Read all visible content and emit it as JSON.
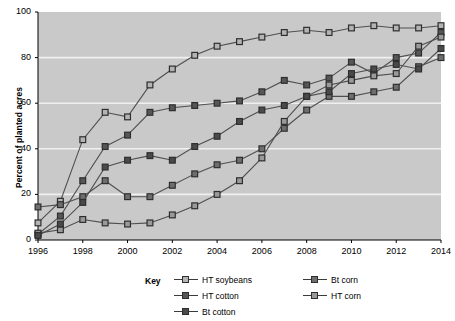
{
  "chart_data": {
    "type": "line",
    "title": "",
    "xlabel": "",
    "ylabel": "Percent of planted acres",
    "xlim": [
      1996,
      2014
    ],
    "ylim": [
      0,
      100
    ],
    "grid": "horizontal",
    "legend_position": "bottom",
    "legend_title": "Key",
    "x": [
      1996,
      1997,
      1998,
      1999,
      2000,
      2001,
      2002,
      2003,
      2004,
      2005,
      2006,
      2007,
      2008,
      2009,
      2010,
      2011,
      2012,
      2013,
      2014
    ],
    "xticks": [
      "1996",
      "1998",
      "2000",
      "2002",
      "2004",
      "2006",
      "2008",
      "2010",
      "2012",
      "2014"
    ],
    "yticks": [
      "0",
      "20",
      "40",
      "60",
      "80",
      "100"
    ],
    "series": [
      {
        "name": "HT soybeans",
        "color": "#4f4f4f",
        "marker_fill": "#b4b4b4",
        "values": [
          7.5,
          17,
          44,
          56,
          54,
          68,
          75,
          81,
          85,
          87,
          89,
          91,
          92,
          91,
          93,
          94,
          93,
          93,
          94
        ]
      },
      {
        "name": "Bt corn",
        "color": "#4f4f4f",
        "marker_fill": "#6e6e6e",
        "values": [
          14.5,
          15.5,
          19,
          26,
          19,
          19,
          24,
          29,
          33,
          35,
          40,
          49,
          57,
          63,
          63,
          65,
          67,
          76,
          80
        ]
      },
      {
        "name": "HT cotton",
        "color": "#4f4f4f",
        "marker_fill": "#565656",
        "values": [
          2.5,
          10.5,
          26,
          41,
          46,
          56,
          58,
          59,
          60,
          61,
          65,
          70,
          68,
          71,
          78,
          73,
          80,
          82,
          91
        ]
      },
      {
        "name": "HT corn",
        "color": "#4f4f4f",
        "marker_fill": "#9a9a9a",
        "values": [
          3,
          4.5,
          9,
          7.5,
          7,
          7.5,
          11,
          15,
          20,
          26,
          36,
          52,
          63,
          68,
          70,
          72,
          73,
          85,
          89
        ]
      },
      {
        "name": "Bt cotton",
        "color": "#4f4f4f",
        "marker_fill": "#4a4a4a",
        "values": [
          2,
          7,
          16.5,
          32,
          35,
          37,
          35,
          41,
          45.5,
          52,
          57,
          59,
          63,
          65,
          73,
          75,
          77,
          75,
          84
        ]
      }
    ]
  },
  "legend": {
    "title": "Key",
    "entries": [
      {
        "label": "HT soybeans"
      },
      {
        "label": "Bt corn"
      },
      {
        "label": "HT cotton"
      },
      {
        "label": "HT corn"
      },
      {
        "label": "Bt cotton"
      }
    ]
  }
}
